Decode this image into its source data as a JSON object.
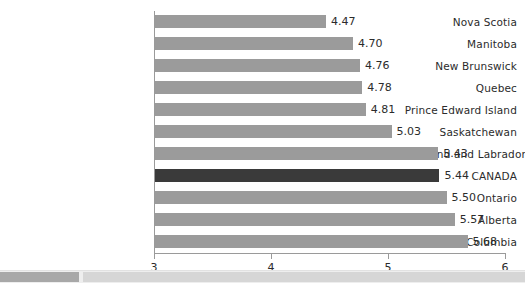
{
  "chart_data": {
    "type": "bar",
    "orientation": "horizontal",
    "title": "",
    "subtitle": "",
    "xlabel": "",
    "ylabel": "",
    "xlim": [
      3,
      6
    ],
    "xticks": [
      "3",
      "4",
      "5",
      "6"
    ],
    "grid": false,
    "legend": null,
    "categories": [
      "Nova Scotia",
      "Manitoba",
      "New Brunswick",
      "Quebec",
      "Prince Edward Island",
      "Saskatchewan",
      "Newfoundland and Labrador",
      "CANADA",
      "Ontario",
      "Alberta",
      "British Columbia"
    ],
    "values": [
      4.47,
      4.7,
      4.76,
      4.78,
      4.81,
      5.03,
      5.43,
      5.44,
      5.5,
      5.57,
      5.68
    ],
    "value_labels": [
      "4.47",
      "4.70",
      "4.76",
      "4.78",
      "4.81",
      "5.03",
      "5.43",
      "5.44",
      "5.50",
      "5.57",
      "5.68"
    ],
    "highlight_index": 7,
    "colors": {
      "bar": "#9b9b9b",
      "bar_highlight": "#3a3a3a",
      "axis": "#9a9a9a",
      "text": "#2b2b2b",
      "background": "#ffffff"
    }
  },
  "scrollbar": {
    "name": "horizontal-scrollbar",
    "thumb_position_percent": 0,
    "thumb_width_percent": 15,
    "track_color": "#d6d6d6",
    "thumb_color": "#a8a8a8"
  }
}
